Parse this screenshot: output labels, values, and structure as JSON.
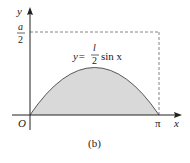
{
  "figure": {
    "caption": "(b)",
    "axes": {
      "x_label": "x",
      "y_label": "y",
      "origin_label": "O",
      "x_tick_label": "π",
      "y_tick_numerator": "a",
      "y_tick_denominator": "2"
    },
    "curve_label": {
      "prefix": "y=",
      "numerator": "l",
      "denominator": "2",
      "suffix": "sin x"
    },
    "colors": {
      "fill": "#d9d9d9",
      "stroke": "#555555",
      "axis": "#222222",
      "dashed": "#666666"
    }
  }
}
